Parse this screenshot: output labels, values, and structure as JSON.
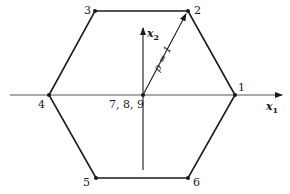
{
  "diagram": {
    "type": "hexagon-constellation",
    "colors": {
      "stroke": "#1a1a1a",
      "axis": "#555555",
      "background": "#ffffff"
    },
    "axes": {
      "x1": {
        "label": "x",
        "subscript": "1"
      },
      "x2": {
        "label": "x",
        "subscript": "2"
      }
    },
    "radius_label": "ρ = 1",
    "center_label": "7, 8, 9",
    "vertices": [
      {
        "label": "1"
      },
      {
        "label": "2"
      },
      {
        "label": "3"
      },
      {
        "label": "4"
      },
      {
        "label": "5"
      },
      {
        "label": "6"
      }
    ]
  }
}
